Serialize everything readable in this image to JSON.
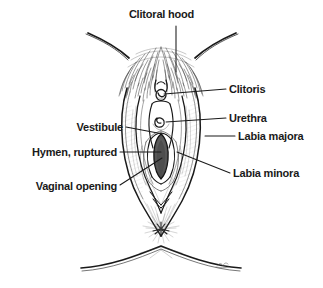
{
  "figure": {
    "type": "anatomical-illustration",
    "style": "black-and-white pen-and-ink line drawing with stipple/hatch shading",
    "background_color": "#ffffff",
    "line_color": "#1a1a1a",
    "width": 323,
    "height": 288
  },
  "labels": [
    {
      "id": "clitoral-hood",
      "text": "Clitoral hood",
      "side": "center",
      "text_x": 176,
      "text_y": 14,
      "leader": {
        "from_x": 176,
        "from_y": 26,
        "to_x": 176,
        "to_y": 72
      }
    },
    {
      "id": "clitoris",
      "text": "Clitoris",
      "side": "right",
      "text_x": 229,
      "text_y": 83,
      "leader": {
        "from_x": 226,
        "from_y": 89,
        "to_x": 164,
        "to_y": 94
      }
    },
    {
      "id": "urethra",
      "text": "Urethra",
      "side": "right",
      "text_x": 229,
      "text_y": 112,
      "leader": {
        "from_x": 226,
        "from_y": 118,
        "to_x": 166,
        "to_y": 122
      }
    },
    {
      "id": "labia-majora",
      "text": "Labia majora",
      "side": "right",
      "text_x": 238,
      "text_y": 131,
      "leader": {
        "from_x": 235,
        "from_y": 136,
        "to_x": 205,
        "to_y": 136
      }
    },
    {
      "id": "labia-minora",
      "text": "Labia minora",
      "side": "right",
      "text_x": 233,
      "text_y": 168,
      "leader": {
        "from_x": 230,
        "from_y": 173,
        "to_x": 177,
        "to_y": 152
      }
    },
    {
      "id": "vestibule",
      "text": "Vestibule",
      "side": "left",
      "text_x": 123,
      "text_y": 122,
      "leader": {
        "from_x": 126,
        "from_y": 127,
        "to_x": 163,
        "to_y": 134
      }
    },
    {
      "id": "hymen-ruptured",
      "text": "Hymen, ruptured",
      "side": "left",
      "text_x": 117,
      "text_y": 147,
      "leader": {
        "from_x": 120,
        "from_y": 152,
        "to_x": 161,
        "to_y": 152
      }
    },
    {
      "id": "vaginal-opening",
      "text": "Vaginal opening",
      "side": "left",
      "text_x": 117,
      "text_y": 181,
      "leader": {
        "from_x": 120,
        "from_y": 185,
        "to_x": 162,
        "to_y": 158
      }
    }
  ],
  "signature": {
    "present": true,
    "x": 222,
    "y": 264,
    "description": "artist initials mark on lower right thigh line"
  }
}
